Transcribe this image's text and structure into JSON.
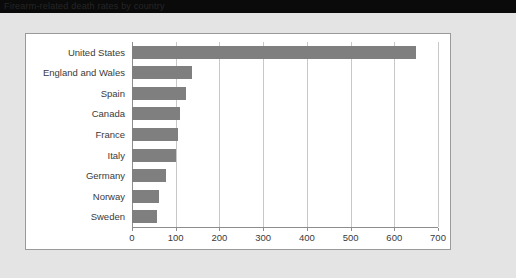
{
  "titlebar": {
    "text": "Firearm-related death rates by country"
  },
  "chart_data": {
    "type": "bar",
    "orientation": "horizontal",
    "title": "",
    "subtitle": "",
    "xlabel": "",
    "ylabel": "",
    "categories": [
      "United States",
      "England and Wales",
      "Spain",
      "Canada",
      "France",
      "Italy",
      "Germany",
      "Norway",
      "Sweden"
    ],
    "values": [
      650,
      138,
      124,
      110,
      105,
      100,
      78,
      62,
      57
    ],
    "xlim": [
      0,
      700
    ],
    "xticks": [
      0,
      100,
      200,
      300,
      400,
      500,
      600,
      700
    ],
    "xtick_labels": [
      "0",
      "100",
      "200",
      "300",
      "400",
      "500",
      "600",
      "700"
    ],
    "grid": true,
    "legend": false,
    "bar_color": "#7f7f7f",
    "gridline_color": "#c8c8c8",
    "axis_color": "#8d8d8d",
    "panel_background": "#ffffff",
    "page_background": "#e4e4e4"
  }
}
